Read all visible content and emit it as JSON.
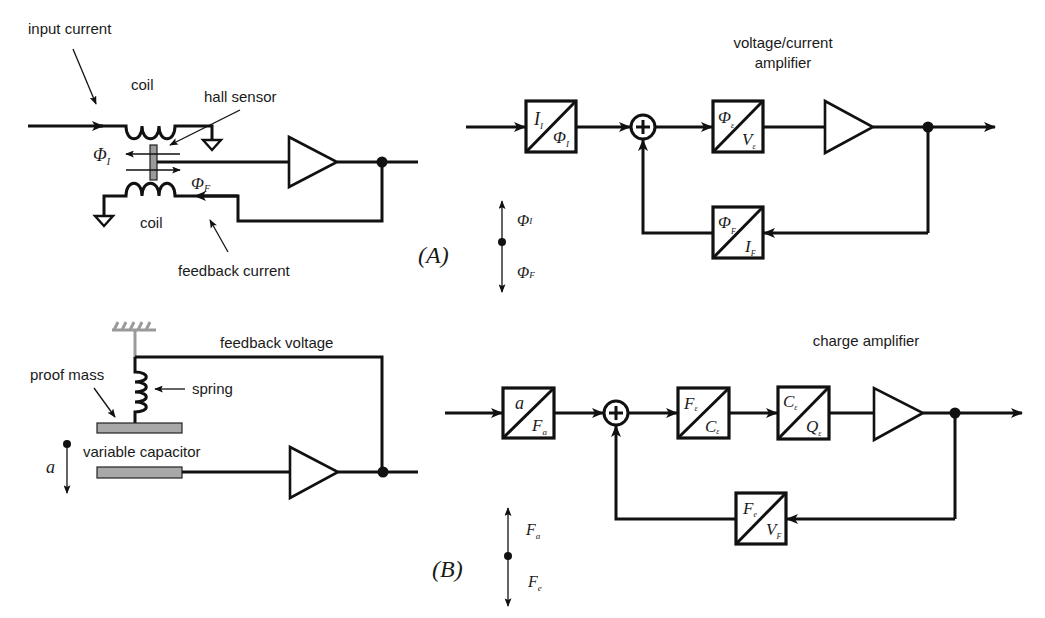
{
  "figure": {
    "panel_a": {
      "label": "(A)",
      "circuit": {
        "input_current_label": "input current",
        "coil_top_label": "coil",
        "coil_bottom_label": "coil",
        "hall_sensor_label": "hall sensor",
        "feedback_current_label": "feedback current",
        "phi_i": {
          "base": "Φ",
          "sub": "I"
        },
        "phi_f": {
          "base": "Φ",
          "sub": "F"
        }
      },
      "block_diagram": {
        "amplifier_label_line1": "voltage/current",
        "amplifier_label_line2": "amplifier",
        "blocks": [
          {
            "top": "I",
            "top_sub": "I",
            "bottom": "Φ",
            "bottom_sub": "I"
          },
          {
            "top": "Φ",
            "top_sub": "ε",
            "bottom": "V",
            "bottom_sub": "ε"
          },
          {
            "top": "Φ",
            "top_sub": "F",
            "bottom": "I",
            "bottom_sub": "F"
          }
        ],
        "summer": "+"
      },
      "direction_legend": {
        "up": {
          "base": "Φ",
          "sub": "I"
        },
        "down": {
          "base": "Φ",
          "sub": "F"
        }
      }
    },
    "panel_b": {
      "label": "(B)",
      "circuit": {
        "feedback_voltage_label": "feedback voltage",
        "proof_mass_label": "proof mass",
        "spring_label": "spring",
        "variable_capacitor_label": "variable capacitor",
        "accel_label": "a"
      },
      "block_diagram": {
        "amplifier_label": "charge amplifier",
        "blocks": [
          {
            "top": "a",
            "top_sub": "",
            "bottom": "F",
            "bottom_sub": "a"
          },
          {
            "top": "F",
            "top_sub": "ε",
            "bottom": "C",
            "bottom_sub": "ε"
          },
          {
            "top": "C",
            "top_sub": "ε",
            "bottom": "Q",
            "bottom_sub": "ε"
          },
          {
            "top": "F",
            "top_sub": "e",
            "bottom": "V",
            "bottom_sub": "F"
          }
        ],
        "summer": "+"
      },
      "direction_legend": {
        "up": {
          "base": "F",
          "sub": "a"
        },
        "down": {
          "base": "F",
          "sub": "e"
        }
      }
    }
  }
}
